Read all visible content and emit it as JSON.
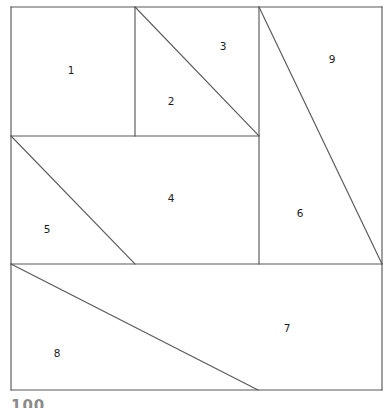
{
  "figure": {
    "stroke_color": "#595959",
    "fill_color": "#ffffff",
    "label_color": "#1c1c1c",
    "outer_square": {
      "x1": 11,
      "y1": 7,
      "x2": 382,
      "y2": 390
    },
    "regions": [
      {
        "id": "1",
        "label": "1",
        "label_x": 71,
        "label_y": 71,
        "shape": "rectangle",
        "points": "11,7 135,7 135,136 11,136"
      },
      {
        "id": "2",
        "label": "2",
        "label_x": 171,
        "label_y": 102,
        "shape": "triangle",
        "points": "135,7 259,136 135,136"
      },
      {
        "id": "3",
        "label": "3",
        "label_x": 223,
        "label_y": 47,
        "shape": "triangle",
        "points": "135,7 259,7 259,136"
      },
      {
        "id": "4",
        "label": "4",
        "label_x": 171,
        "label_y": 199,
        "shape": "trapezoid",
        "points": "11,136 259,136 259,264 135,264"
      },
      {
        "id": "5",
        "label": "5",
        "label_x": 47,
        "label_y": 230,
        "shape": "triangle",
        "points": "11,136 135,264 11,264"
      },
      {
        "id": "6",
        "label": "6",
        "label_x": 300,
        "label_y": 214,
        "shape": "triangle",
        "points": "259,7 382,264 259,264"
      },
      {
        "id": "7",
        "label": "7",
        "label_x": 287,
        "label_y": 329,
        "shape": "trapezoid",
        "points": "11,264 382,264 382,390 258,390"
      },
      {
        "id": "8",
        "label": "8",
        "label_x": 57,
        "label_y": 354,
        "shape": "trapezoid",
        "points": "11,264 258,390 11,390"
      },
      {
        "id": "9",
        "label": "9",
        "label_x": 332,
        "label_y": 60,
        "shape": "triangle",
        "points": "259,7 382,7 382,264"
      }
    ],
    "edges": [
      {
        "name": "outer-top",
        "x1": 11,
        "y1": 7,
        "x2": 382,
        "y2": 7
      },
      {
        "name": "outer-right",
        "x1": 382,
        "y1": 7,
        "x2": 382,
        "y2": 390
      },
      {
        "name": "outer-bottom",
        "x1": 382,
        "y1": 390,
        "x2": 11,
        "y2": 390
      },
      {
        "name": "outer-left",
        "x1": 11,
        "y1": 390,
        "x2": 11,
        "y2": 7
      },
      {
        "name": "vertical-1-2",
        "x1": 135,
        "y1": 7,
        "x2": 135,
        "y2": 136
      },
      {
        "name": "vertical-3-9",
        "x1": 259,
        "y1": 7,
        "x2": 259,
        "y2": 264
      },
      {
        "name": "horizontal-upper",
        "x1": 11,
        "y1": 136,
        "x2": 259,
        "y2": 136
      },
      {
        "name": "horizontal-lower",
        "x1": 11,
        "y1": 264,
        "x2": 382,
        "y2": 264
      },
      {
        "name": "diagonal-2-3",
        "x1": 135,
        "y1": 7,
        "x2": 259,
        "y2": 136
      },
      {
        "name": "diagonal-4-5",
        "x1": 11,
        "y1": 136,
        "x2": 135,
        "y2": 264
      },
      {
        "name": "diagonal-6-9",
        "x1": 259,
        "y1": 7,
        "x2": 382,
        "y2": 264
      },
      {
        "name": "diagonal-7-8",
        "x1": 11,
        "y1": 264,
        "x2": 258,
        "y2": 390
      }
    ]
  },
  "footer": {
    "cut_off_text": "100"
  }
}
